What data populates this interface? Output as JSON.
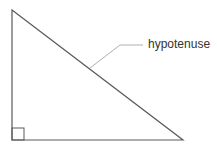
{
  "diagram": {
    "type": "right-triangle",
    "vertices": {
      "top": [
        12,
        10
      ],
      "bottom_left": [
        12,
        140
      ],
      "bottom_right": [
        183,
        140
      ]
    },
    "right_angle_marker": {
      "x": 12,
      "y": 128,
      "size": 12
    },
    "leader_line": {
      "points": [
        [
          90,
          68
        ],
        [
          120,
          45
        ],
        [
          143,
          45
        ]
      ]
    },
    "labels": {
      "hypotenuse": "hypotenuse"
    },
    "colors": {
      "triangle_stroke": "#5a5a5a",
      "marker_stroke": "#5a5a5a",
      "leader_stroke": "#b0b0b0",
      "text": "#333333",
      "background": "#ffffff"
    }
  }
}
